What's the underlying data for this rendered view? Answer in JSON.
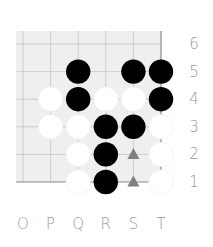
{
  "board": {
    "columns": [
      "O",
      "P",
      "Q",
      "R",
      "S",
      "T"
    ],
    "rows": [
      "6",
      "5",
      "4",
      "3",
      "2",
      "1"
    ],
    "stones": [
      {
        "col": "Q",
        "row": "5",
        "color": "black"
      },
      {
        "col": "S",
        "row": "5",
        "color": "black"
      },
      {
        "col": "T",
        "row": "5",
        "color": "black"
      },
      {
        "col": "P",
        "row": "4",
        "color": "white"
      },
      {
        "col": "Q",
        "row": "4",
        "color": "black"
      },
      {
        "col": "R",
        "row": "4",
        "color": "white"
      },
      {
        "col": "S",
        "row": "4",
        "color": "white"
      },
      {
        "col": "T",
        "row": "4",
        "color": "black"
      },
      {
        "col": "P",
        "row": "3",
        "color": "white"
      },
      {
        "col": "Q",
        "row": "3",
        "color": "white"
      },
      {
        "col": "R",
        "row": "3",
        "color": "black"
      },
      {
        "col": "S",
        "row": "3",
        "color": "black"
      },
      {
        "col": "T",
        "row": "3",
        "color": "white"
      },
      {
        "col": "Q",
        "row": "2",
        "color": "white"
      },
      {
        "col": "R",
        "row": "2",
        "color": "black"
      },
      {
        "col": "T",
        "row": "2",
        "color": "white"
      },
      {
        "col": "Q",
        "row": "1",
        "color": "white"
      },
      {
        "col": "R",
        "row": "1",
        "color": "black"
      },
      {
        "col": "T",
        "row": "1",
        "color": "white"
      }
    ],
    "markers": [
      {
        "col": "S",
        "row": "2",
        "shape": "triangle-icon"
      },
      {
        "col": "S",
        "row": "1",
        "shape": "triangle-icon"
      }
    ],
    "colors": {
      "board_fill": "#efefef",
      "grid_line": "#c4c4c4",
      "edge_line": "#8a8a8a",
      "black_stone": "#000000",
      "white_stone": "#ffffff",
      "marker": "#808080",
      "label": "#9a9a9a"
    }
  }
}
